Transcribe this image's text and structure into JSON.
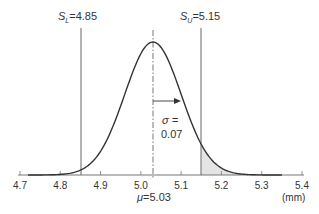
{
  "chart_data": {
    "type": "area",
    "title": "",
    "xlabel": "(mm)",
    "ylabel": "",
    "xlim": [
      4.7,
      5.4
    ],
    "x_ticks": [
      4.7,
      4.8,
      4.9,
      5.0,
      5.1,
      5.2,
      5.3,
      5.4
    ],
    "x_tick_labels": [
      "4.7",
      "4.8",
      "4.9",
      "5.0",
      "5.1",
      "5.2",
      "5.3",
      "5.4"
    ],
    "grid": false,
    "distribution": {
      "name": "normal",
      "mean": 5.03,
      "sigma": 0.07
    },
    "curve_range": [
      4.72,
      5.35
    ],
    "lower_spec": {
      "label_symbol": "S",
      "label_sub": "L",
      "value": 4.85,
      "label": "S_L=4.85"
    },
    "upper_spec": {
      "label_symbol": "S",
      "label_sub": "U",
      "value": 5.15,
      "label": "S_U=5.15"
    },
    "shaded_region": {
      "from": 5.15,
      "to": 5.35,
      "description": "tail beyond upper spec limit"
    },
    "annotations": [
      {
        "text": "σ =",
        "value_text": "0.07",
        "note": "arrow from mean to mean+σ"
      },
      {
        "text": "μ =5.03"
      }
    ]
  },
  "labels": {
    "sl_symbol": "S",
    "sl_sub": "L",
    "sl_value": "=4.85",
    "su_symbol": "S",
    "su_sub": "U",
    "su_value": "=5.15",
    "sigma_symbol": "σ =",
    "sigma_value": "0.07",
    "mu_symbol": "μ",
    "mu_value": "=5.03",
    "unit": "(mm)"
  },
  "colors": {
    "curve": "#333333",
    "axis": "#666666",
    "spec_line": "#555555",
    "shade": "#e4e4e4",
    "text": "#333333"
  }
}
